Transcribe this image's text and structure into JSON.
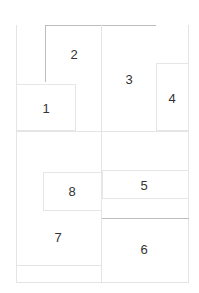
{
  "diagram": {
    "type": "floor-plan-regions",
    "regions": [
      {
        "id": "1",
        "label": "1"
      },
      {
        "id": "2",
        "label": "2"
      },
      {
        "id": "3",
        "label": "3"
      },
      {
        "id": "4",
        "label": "4"
      },
      {
        "id": "5",
        "label": "5"
      },
      {
        "id": "6",
        "label": "6"
      },
      {
        "id": "7",
        "label": "7"
      },
      {
        "id": "8",
        "label": "8"
      }
    ],
    "colors": {
      "line": "#e4e4e4",
      "line_dark": "#bdbdbd",
      "text": "#333333",
      "background": "#ffffff"
    }
  }
}
